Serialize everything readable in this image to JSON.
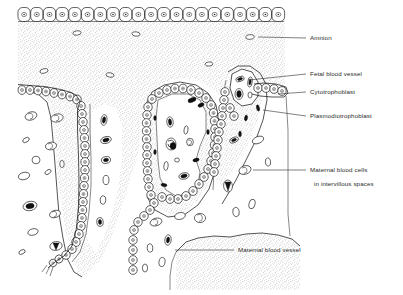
{
  "figure": {
    "background_color": "#ffffff",
    "ink_color": "#1b1b1b",
    "stipple_color": "#9a9a9a"
  },
  "labels": [
    {
      "id": "amnion",
      "text": "Amnion",
      "text_x": 310,
      "text_y": 40,
      "leader": "M 252 37 L 306 38",
      "pointer_x": 252,
      "pointer_y": 37
    },
    {
      "id": "fetal-blood-vessel",
      "text": "Fetal blood vessel",
      "text_x": 310,
      "text_y": 76,
      "leader": "M 249 80 L 306 74",
      "pointer_x": 249,
      "pointer_y": 80
    },
    {
      "id": "cytotrophoblast",
      "text": "Cytotrophoblast",
      "text_x": 310,
      "text_y": 94,
      "leader": "M 276 95 L 306 92",
      "pointer_x": 276,
      "pointer_y": 95
    },
    {
      "id": "plasmodiotrophoblast",
      "text": "Plasmodiotrophoblast",
      "text_x": 310,
      "text_y": 118,
      "leader": "M 262 110 L 306 116",
      "pointer_x": 262,
      "pointer_y": 110
    },
    {
      "id": "maternal-blood-cells",
      "text": "Maternal blood cells",
      "text_x": 310,
      "text_y": 172,
      "leader": "M 253 170 L 306 170",
      "pointer_x": 253,
      "pointer_y": 170
    },
    {
      "id": "maternal-blood-cells-line2",
      "text": "in intervillous spaces",
      "text_x": 310,
      "text_y": 186,
      "leader": "",
      "pointer_x": null,
      "pointer_y": null
    },
    {
      "id": "maternal-blood-vessel",
      "text": "Maternal blood vessel",
      "text_x": 238,
      "text_y": 251,
      "leader": "M 175 250 L 234 250",
      "pointer_x": 175,
      "pointer_y": 250
    }
  ],
  "structures": [
    {
      "id": "amnion-epithelium",
      "name": "Amnion epithelium",
      "cell_count": 21,
      "row_y": 12,
      "row_x_start": 18,
      "row_x_end": 284
    },
    {
      "id": "chorionic-stroma",
      "name": "Chorionic plate stroma (stippled)"
    },
    {
      "id": "villus-left",
      "name": "Left villus trunk"
    },
    {
      "id": "villus-center",
      "name": "Central villus with fetal capillaries"
    },
    {
      "id": "villus-right",
      "name": "Right villus with fetal blood vessel"
    },
    {
      "id": "intervillous-space",
      "name": "Intervillous space containing maternal blood cells"
    },
    {
      "id": "maternal-blood-vessel-band",
      "name": "Maternal blood vessel (stippled band, lower right)"
    }
  ]
}
